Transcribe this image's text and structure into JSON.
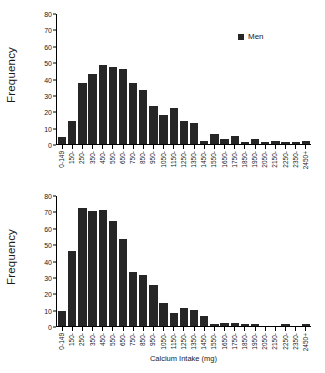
{
  "chart_data": {
    "type": "bar",
    "title": "",
    "xlabel": "Calcium Intake (mg)",
    "ylabel": "Frequency",
    "ylim": [
      0,
      80
    ],
    "yticks": [
      0,
      10,
      20,
      30,
      40,
      50,
      60,
      70,
      80
    ],
    "grid": false,
    "legend_position": "top-right",
    "categories": [
      "0-149",
      "150-",
      "250-",
      "350-",
      "450-",
      "550-",
      "650-",
      "750-",
      "850-",
      "950-",
      "1050-",
      "1150-",
      "1250-",
      "1350-",
      "1450-",
      "1550-",
      "1650-",
      "1750-",
      "1850-",
      "1950-",
      "2050-",
      "2150-",
      "2250-",
      "2350-",
      "2450+"
    ],
    "series": [
      {
        "name": "Men",
        "values": [
          4,
          14,
          37,
          43,
          48,
          47,
          46,
          37,
          33,
          23,
          18,
          22,
          14,
          13,
          2,
          6,
          3,
          5,
          1,
          3,
          1,
          2,
          1,
          1,
          2
        ]
      },
      {
        "name": "Women",
        "values": [
          9,
          46,
          72,
          70,
          71,
          64,
          53,
          33,
          31,
          25,
          14,
          8,
          11,
          10,
          6,
          1,
          2,
          2,
          1,
          1,
          0,
          0,
          1,
          0,
          1
        ]
      }
    ],
    "bar_color": "#262626"
  },
  "panels": [
    {
      "id": "men",
      "ylabel": "Frequency",
      "legend_label": "Men"
    },
    {
      "id": "women",
      "ylabel": "Frequency",
      "legend_label": "Women"
    }
  ]
}
